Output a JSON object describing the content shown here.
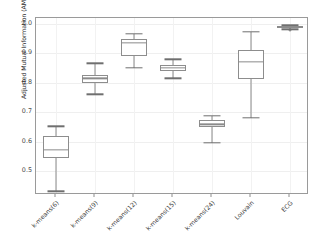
{
  "chart_data": {
    "type": "box",
    "title": "",
    "xlabel": "",
    "ylabel": "Adjusted Mutual Information (AMI)",
    "ylim": [
      0.42,
      1.02
    ],
    "yticks": [
      0.5,
      0.6,
      0.7,
      0.8,
      0.9,
      1.0
    ],
    "ytick_labels": [
      "0.5",
      "0.6",
      "0.7",
      "0.8",
      "0.9",
      "1.0"
    ],
    "grid": true,
    "legend": "none",
    "categories": [
      "k-means(6)",
      "k-means(9)",
      "k-means(12)",
      "k-means(15)",
      "k-means(24)",
      "Louvain",
      "ECG"
    ],
    "boxes": [
      {
        "label": "k-means(6)",
        "whisker_low": 0.433,
        "q1": 0.544,
        "median": 0.574,
        "q3": 0.62,
        "whisker_high": 0.653,
        "outliers": []
      },
      {
        "label": "k-means(9)",
        "whisker_low": 0.761,
        "q1": 0.8,
        "median": 0.815,
        "q3": 0.827,
        "whisker_high": 0.866,
        "outliers": []
      },
      {
        "label": "k-means(12)",
        "whisker_low": 0.852,
        "q1": 0.89,
        "median": 0.935,
        "q3": 0.95,
        "whisker_high": 0.966,
        "outliers": []
      },
      {
        "label": "k-means(15)",
        "whisker_low": 0.815,
        "q1": 0.841,
        "median": 0.85,
        "q3": 0.86,
        "whisker_high": 0.88,
        "outliers": []
      },
      {
        "label": "k-means(24)",
        "whisker_low": 0.596,
        "q1": 0.65,
        "median": 0.659,
        "q3": 0.674,
        "whisker_high": 0.688,
        "outliers": []
      },
      {
        "label": "Louvain",
        "whisker_low": 0.681,
        "q1": 0.812,
        "median": 0.872,
        "q3": 0.913,
        "whisker_high": 0.973,
        "outliers": []
      },
      {
        "label": "ECG",
        "whisker_low": 0.982,
        "q1": 0.987,
        "median": 0.99,
        "q3": 0.992,
        "whisker_high": 0.995,
        "outliers": [
          0.978
        ]
      }
    ],
    "colors": {
      "box_stroke": "#8d8d8d",
      "median_stroke": "#8a8a8a",
      "whisker_stroke": "#8a8a8a",
      "panel_background": "#ffffff",
      "panel_border": "#9a9a9a",
      "gridline": "#efefef",
      "text": "#3a3a3a"
    }
  }
}
